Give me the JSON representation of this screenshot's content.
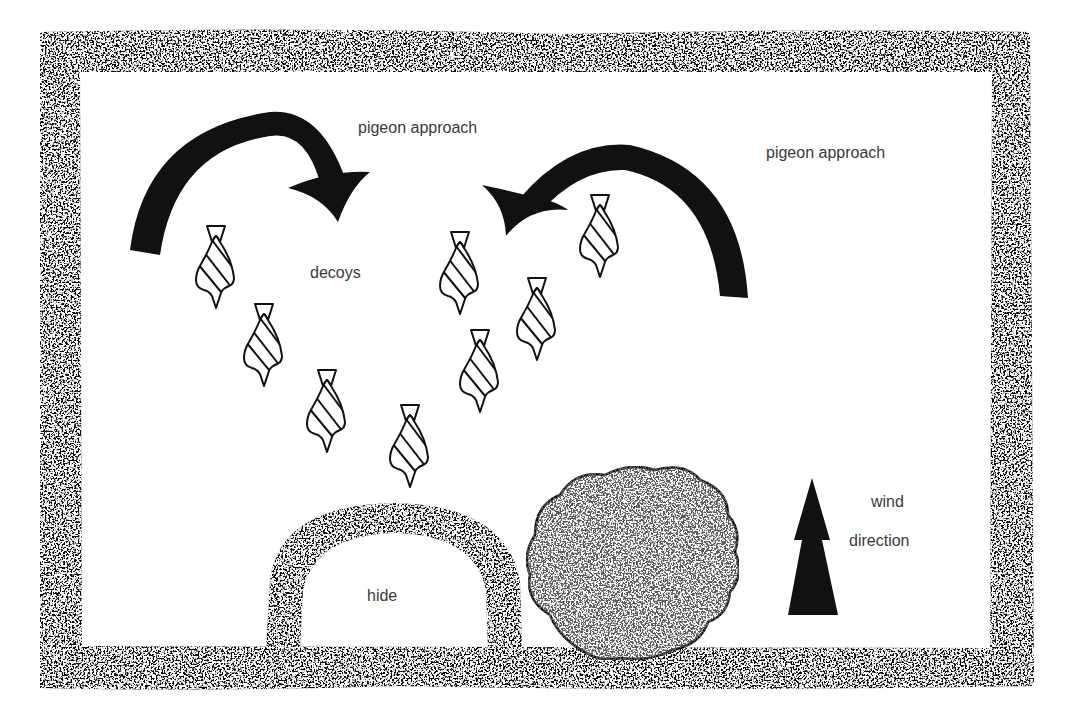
{
  "diagram": {
    "type": "field-layout-illustration",
    "colors": {
      "ink": "#111111",
      "texture_light": "#ffffff",
      "text": "#3a3a3a",
      "background": "#ffffff"
    },
    "labels": {
      "approach_left": "pigeon approach",
      "approach_right": "pigeon approach",
      "decoys": "decoys",
      "hide": "hide",
      "wind_line1": "wind",
      "wind_line2": "direction"
    },
    "elements": {
      "border": "hedge-border",
      "arrows": [
        {
          "name": "approach-arrow-left",
          "direction": "clockwise",
          "target": "decoys"
        },
        {
          "name": "approach-arrow-right",
          "direction": "counter-clockwise",
          "target": "decoys"
        }
      ],
      "decoys": [
        {
          "x": 216,
          "y": 226
        },
        {
          "x": 264,
          "y": 304
        },
        {
          "x": 327,
          "y": 370
        },
        {
          "x": 410,
          "y": 405
        },
        {
          "x": 460,
          "y": 232
        },
        {
          "x": 480,
          "y": 330
        },
        {
          "x": 537,
          "y": 278
        },
        {
          "x": 600,
          "y": 195
        }
      ],
      "hide": "semicircular-hide",
      "bush": "bush",
      "wind_arrow": "upward"
    }
  }
}
